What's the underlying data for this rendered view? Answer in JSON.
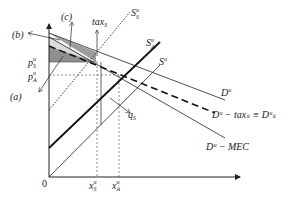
{
  "diagram": {
    "axes": {
      "origin_label": "0",
      "x_ticks": [
        {
          "id": "xS",
          "main": "x",
          "sup": "u",
          "sub": "S"
        },
        {
          "id": "xA",
          "main": "x",
          "sup": "u",
          "sub": "A"
        }
      ],
      "y_ticks": [
        {
          "id": "pS",
          "main": "p",
          "sup": "u",
          "sub": "S"
        },
        {
          "id": "pA",
          "main": "p",
          "sup": "u",
          "sub": "A"
        }
      ]
    },
    "curves": [
      {
        "id": "S_S",
        "main": "S",
        "sup": "u",
        "sub": "S",
        "style": "dotted"
      },
      {
        "id": "S_A",
        "main": "S",
        "sup": "u",
        "sub": "A",
        "style": "thick"
      },
      {
        "id": "S",
        "main": "S",
        "sup": "u",
        "sub": "",
        "style": "thin"
      },
      {
        "id": "D",
        "main": "D",
        "sup": "u",
        "sub": "",
        "style": "thin"
      },
      {
        "id": "D_tax",
        "label": "Dᵘ − taxₛ ≡ Dᵘₛ",
        "style": "dashed"
      },
      {
        "id": "D_MEC",
        "label": "Dᵘ − MEC",
        "style": "thin"
      }
    ],
    "annotations": [
      {
        "id": "a",
        "label": "(a)"
      },
      {
        "id": "b",
        "label": "(b)"
      },
      {
        "id": "c",
        "label": "(c)"
      },
      {
        "id": "tax",
        "main": "tax",
        "sub": "S"
      },
      {
        "id": "q",
        "main": "q",
        "sub": "S"
      }
    ],
    "labels": {
      "origin": "0",
      "a": "(a)",
      "b": "(b)",
      "c": "(c)",
      "tax": "tax",
      "tax_sub": "S",
      "q": "q",
      "q_sub": "S",
      "pS": "p",
      "pS_sup": "u",
      "pS_sub": "S",
      "pA": "p",
      "pA_sup": "u",
      "pA_sub": "A",
      "xS": "x",
      "xS_sup": "u",
      "xS_sub": "S",
      "xA": "x",
      "xA_sup": "u",
      "xA_sub": "A",
      "SS": "S",
      "SS_sup": "u",
      "SS_sub": "S",
      "SA": "S",
      "SA_sup": "u",
      "SA_sub": "A",
      "S": "S",
      "S_sup": "u",
      "D": "D",
      "D_sup": "u",
      "Dtax": "Dᵘ − taxₛ ≡ Dᵘₛ",
      "DMEC": "Dᵘ − MEC"
    },
    "colors": {
      "line": "#222222",
      "shade_dark": "#8a8a8a",
      "shade_mid": "#a9a9a9",
      "shade_light": "#d6d6d6"
    }
  }
}
